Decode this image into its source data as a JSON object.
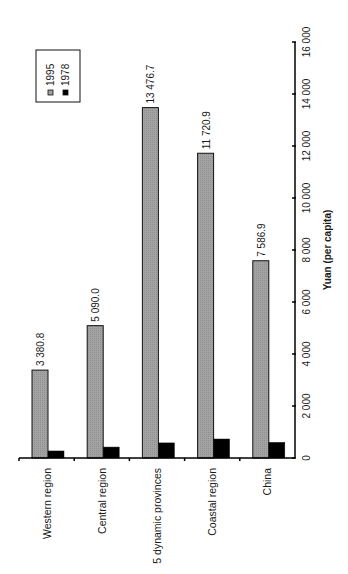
{
  "chart_data": {
    "type": "bar",
    "orientation": "rotated-90-ccw",
    "title": "",
    "xlabel": "",
    "ylabel": "Yuan (per capita)",
    "ylim": [
      0,
      16000
    ],
    "yticks": [
      0,
      2000,
      4000,
      6000,
      8000,
      10000,
      12000,
      14000,
      16000
    ],
    "ytick_labels": [
      "0",
      "2 000",
      "4 000",
      "6 000",
      "8 000",
      "10 000",
      "12 000",
      "14 000",
      "16 000"
    ],
    "grid": false,
    "legend_position": "top-left (rotated, upper-right in chart frame)",
    "categories": [
      "Western region",
      "Central region",
      "5 dynamic provinces",
      "Coastal region",
      "China"
    ],
    "series": [
      {
        "name": "1995",
        "color": "#a0a0a0",
        "values": [
          3380.8,
          5090.0,
          13476.7,
          11720.9,
          7586.9
        ],
        "data_labels": [
          "3 380.8",
          "5 090.0",
          "13 476.7",
          "11 720.9",
          "7 586.9"
        ]
      },
      {
        "name": "1978",
        "color": "#000000",
        "values": [
          270,
          420,
          580,
          730,
          600
        ],
        "data_labels": []
      }
    ]
  },
  "legend": {
    "items": [
      {
        "label": "1995",
        "color": "#a0a0a0"
      },
      {
        "label": "1978",
        "color": "#000000"
      }
    ]
  }
}
